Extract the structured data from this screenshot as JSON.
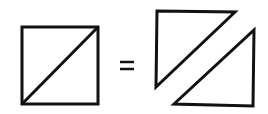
{
  "diagram": {
    "stroke_color": "#111111",
    "background": "#ffffff",
    "operator": "=",
    "left": {
      "shape": "square-with-diagonal",
      "square": {
        "x": 22,
        "y": 27,
        "w": 76,
        "h": 77
      },
      "diagonal": {
        "x1": 22,
        "y1": 104,
        "x2": 98,
        "y2": 27
      }
    },
    "right": {
      "shapes": [
        {
          "name": "upper-left-triangle",
          "points": "157,11 235,12 156,87"
        },
        {
          "name": "lower-right-triangle",
          "points": "254,30 253,106 174,104"
        }
      ]
    }
  }
}
